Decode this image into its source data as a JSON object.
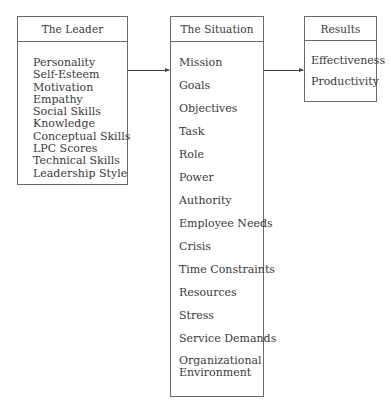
{
  "diagram": {
    "leader": {
      "title": "The Leader",
      "items": [
        "Personality",
        "Self-Esteem",
        "Motivation",
        "Empathy",
        "Social Skills",
        "Knowledge",
        "Conceptual Skills",
        "LPC Scores",
        "Technical Skills",
        "Leadership Style"
      ]
    },
    "situation": {
      "title": "The Situation",
      "items": [
        "Mission",
        "Goals",
        "Objectives",
        "Task",
        "Role",
        "Power",
        "Authority",
        "Employee Needs",
        "Crisis",
        "Time Constraints",
        "Resources",
        "Stress",
        "Service Demands",
        "Organizational Environment"
      ]
    },
    "results": {
      "title": "Results",
      "items": [
        "Effectiveness",
        "Productivity"
      ]
    },
    "edges": [
      {
        "from": "The Leader",
        "to": "The Situation"
      },
      {
        "from": "The Situation",
        "to": "Results"
      }
    ],
    "colors": {
      "border": "#6a6a6a",
      "text": "#3a3a3a",
      "arrow": "#444444"
    }
  }
}
